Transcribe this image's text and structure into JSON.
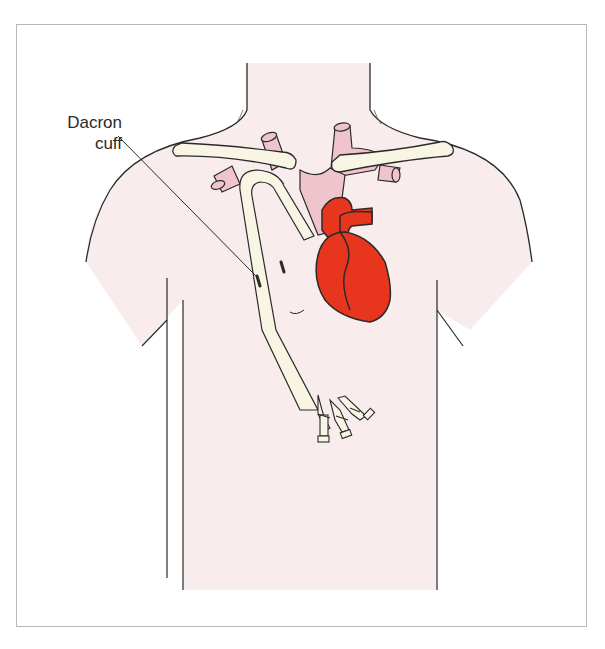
{
  "figure": {
    "labels": [
      {
        "id": "dacron-cuff",
        "line1": "Dacron",
        "line2": "cuff"
      }
    ]
  },
  "colors": {
    "background": "#ffffff",
    "frame_border": "#b8b8b8",
    "skin": "#f8ecec",
    "outline": "#2a2a2a",
    "bone": "#f8f5e4",
    "vessel": "#f0c4cc",
    "heart": "#e8361e",
    "catheter": "#f8f5e4"
  }
}
